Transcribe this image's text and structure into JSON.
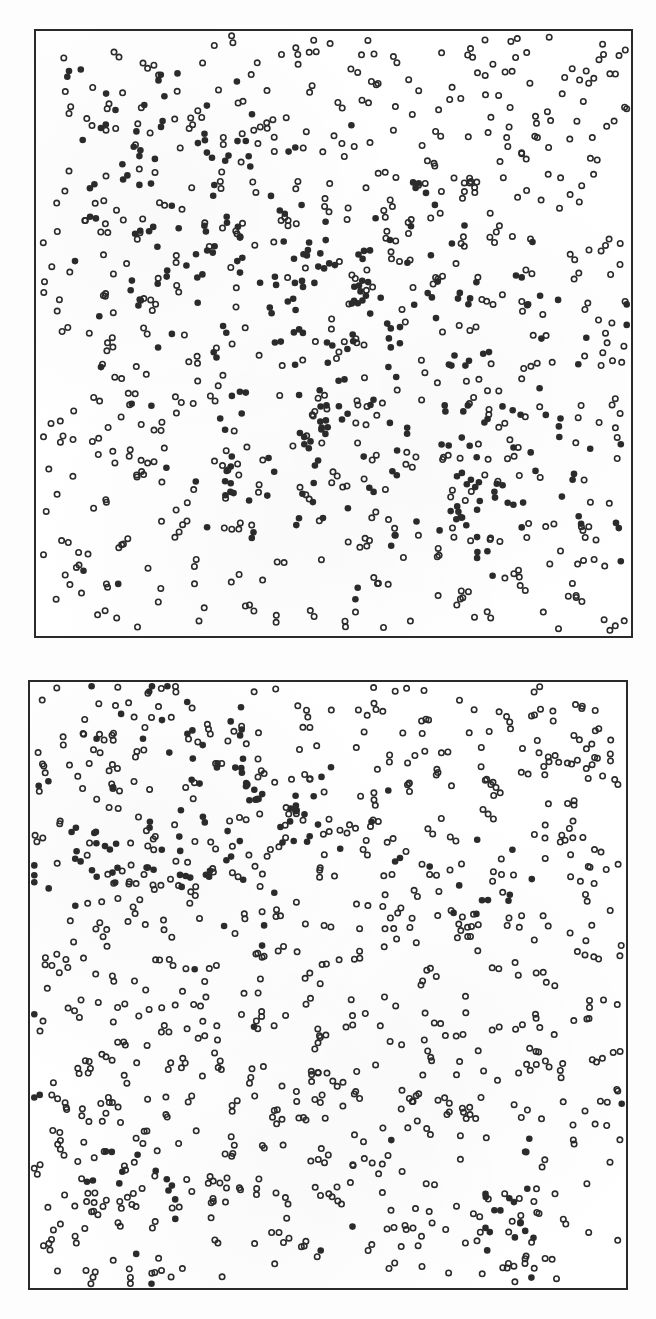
{
  "figure": {
    "background": "#fdfdfd",
    "frame_color": "#2a2a2a",
    "marker_color": "#2b2b2b",
    "marker_radius": 3.3,
    "hollow_stroke": 1.6
  },
  "panels": [
    {
      "id": "top",
      "hollow_count": 560,
      "filled_count": 260,
      "seed": 17,
      "filled_clusters": [
        {
          "cx": 0.22,
          "cy": 0.18,
          "sx": 0.1,
          "sy": 0.08,
          "w": 1.0
        },
        {
          "cx": 0.45,
          "cy": 0.4,
          "sx": 0.12,
          "sy": 0.1,
          "w": 1.6
        },
        {
          "cx": 0.62,
          "cy": 0.45,
          "sx": 0.12,
          "sy": 0.12,
          "w": 1.4
        },
        {
          "cx": 0.4,
          "cy": 0.68,
          "sx": 0.1,
          "sy": 0.07,
          "w": 1.0
        },
        {
          "cx": 0.68,
          "cy": 0.78,
          "sx": 0.13,
          "sy": 0.08,
          "w": 1.2
        },
        {
          "cx": 0.25,
          "cy": 0.5,
          "sx": 0.1,
          "sy": 0.12,
          "w": 0.8
        },
        {
          "cx": 0.1,
          "cy": 0.92,
          "sx": 0.05,
          "sy": 0.05,
          "w": 0.3
        },
        {
          "cx": 0.88,
          "cy": 0.6,
          "sx": 0.06,
          "sy": 0.15,
          "w": 0.5
        }
      ]
    },
    {
      "id": "bottom",
      "hollow_count": 760,
      "filled_count": 130,
      "seed": 91,
      "filled_clusters": [
        {
          "cx": 0.38,
          "cy": 0.22,
          "sx": 0.13,
          "sy": 0.07,
          "w": 1.8
        },
        {
          "cx": 0.15,
          "cy": 0.3,
          "sx": 0.09,
          "sy": 0.04,
          "w": 0.9
        },
        {
          "cx": 0.22,
          "cy": 0.1,
          "sx": 0.1,
          "sy": 0.06,
          "w": 0.5
        },
        {
          "cx": 0.75,
          "cy": 0.34,
          "sx": 0.04,
          "sy": 0.03,
          "w": 0.3
        },
        {
          "cx": 0.82,
          "cy": 0.9,
          "sx": 0.04,
          "sy": 0.05,
          "w": 0.5
        },
        {
          "cx": 0.2,
          "cy": 0.84,
          "sx": 0.06,
          "sy": 0.05,
          "w": 0.25
        },
        {
          "cx": 0.5,
          "cy": 0.62,
          "sx": 0.3,
          "sy": 0.25,
          "w": 0.4
        }
      ]
    }
  ],
  "chart_data": [
    {
      "type": "scatter",
      "title": "",
      "xlabel": "",
      "ylabel": "",
      "grid": false,
      "legend": [],
      "series": [
        {
          "name": "hollow",
          "marker": "open-circle",
          "approx_count": 560
        },
        {
          "name": "filled",
          "marker": "filled-circle",
          "approx_count": 260,
          "pattern": "clustered in central and lower-right bands, sparse at top-right and edges"
        }
      ],
      "xlim": [
        0,
        1
      ],
      "ylim": [
        0,
        1
      ]
    },
    {
      "type": "scatter",
      "title": "",
      "xlabel": "",
      "ylabel": "",
      "grid": false,
      "legend": [],
      "series": [
        {
          "name": "hollow",
          "marker": "open-circle",
          "approx_count": 760
        },
        {
          "name": "filled",
          "marker": "filled-circle",
          "approx_count": 130,
          "pattern": "dense band across upper-left third (y≈0.15–0.35), small cluster at bottom-right (x≈0.82,y≈0.9), scattered elsewhere"
        }
      ],
      "xlim": [
        0,
        1
      ],
      "ylim": [
        0,
        1
      ]
    }
  ]
}
